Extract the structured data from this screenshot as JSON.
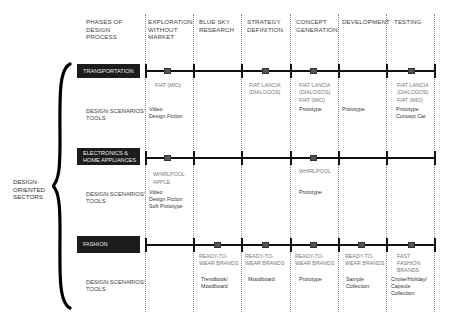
{
  "header": {
    "corner": [
      "PHASES OF",
      "DESIGN",
      "PROCESS"
    ],
    "phases": [
      {
        "lines": [
          "EXPLORATION",
          "WITHOUT",
          "MARKET"
        ]
      },
      {
        "lines": [
          "BLUE SKY",
          "RESEARCH"
        ]
      },
      {
        "lines": [
          "STRATEGY",
          "DEFINITION"
        ]
      },
      {
        "lines": [
          "CONCEPT",
          "GENERATION"
        ]
      },
      {
        "lines": [
          "DEVELOPMENT"
        ]
      },
      {
        "lines": [
          "TESTING"
        ]
      }
    ]
  },
  "group_label": [
    "DESIGN-",
    "ORIENTED",
    "SECTORS"
  ],
  "tools_label": [
    "DESIGN SCENARIOS'",
    "TOOLS"
  ],
  "sectors": [
    {
      "name": "TRANSPORTATION",
      "markers": [
        0,
        2,
        3,
        5
      ],
      "companies": [
        [
          "FIAT (MIO)"
        ],
        [],
        [
          "FIAT LANCIA",
          "(DIALOGOS)"
        ],
        [
          "FIAT LANCIA",
          "(DIALOGOS)",
          "FIAT (MIO)"
        ],
        [],
        [
          "FIAT LANCIA",
          "(DIALOGOS)",
          "FIAT (MIO)"
        ]
      ],
      "tools": [
        [
          "Video",
          "Design Fiction"
        ],
        [],
        [],
        [
          "Prototype"
        ],
        [
          "Prototype"
        ],
        [
          "Prototype",
          "Concept Car"
        ]
      ]
    },
    {
      "name": "ELECTRONICS & HOME APPLIANCES",
      "name_lines": [
        "ELECTRONICS &",
        "HOME APPLIANCES"
      ],
      "markers": [
        0,
        3
      ],
      "companies": [
        [
          "WHIRLPOOL",
          "APPLE"
        ],
        [],
        [],
        [
          "WHIRLPOOL"
        ],
        [],
        []
      ],
      "tools": [
        [
          "Video",
          "Design Fiction",
          "Soft Prototype"
        ],
        [],
        [],
        [
          "Prototype"
        ],
        [],
        []
      ]
    },
    {
      "name": "FASHION",
      "markers": [
        1,
        2,
        3,
        4,
        5
      ],
      "companies": [
        [],
        [
          "READY-TO-",
          "WEAR BRANDS"
        ],
        [
          "READY-TO-",
          "WEAR BRANDS"
        ],
        [
          "READY-TO-",
          "WEAR BRANDS"
        ],
        [
          "READY-TO-",
          "WEAR BRANDS"
        ],
        [
          "FAST",
          "FASHION",
          "BRANDS"
        ]
      ],
      "tools": [
        [],
        [
          "Trendbook/",
          "Moodboard"
        ],
        [
          "Moodboard"
        ],
        [
          "Prototype"
        ],
        [
          "Sample",
          "Collection"
        ],
        [
          "Cruise/Holiday/",
          "Capsule",
          "Collection"
        ]
      ]
    }
  ],
  "colors": {
    "label_bg": "#1c1c1c",
    "label_text": "#eaeaea",
    "timeline": "#111111",
    "marker": "#555555"
  }
}
